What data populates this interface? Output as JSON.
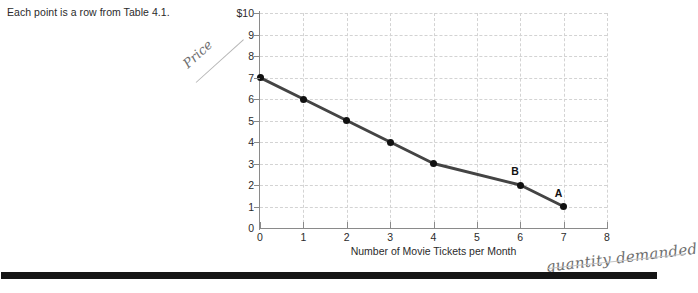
{
  "caption": "Each point is a row from Table 4.1.",
  "chart_data": {
    "type": "line",
    "title": "",
    "xlabel": "Number of Movie Tickets per Month",
    "ylabel": "Price of Movie Tickets",
    "x": [
      0,
      1,
      2,
      3,
      4,
      6,
      7
    ],
    "values": [
      7,
      6,
      5,
      4,
      3,
      2,
      1
    ],
    "xlim": [
      0,
      8
    ],
    "ylim": [
      0,
      10
    ],
    "xticks": [
      "0",
      "1",
      "2",
      "3",
      "4",
      "5",
      "6",
      "7",
      "8"
    ],
    "yticks": [
      "$10",
      "9",
      "8",
      "7",
      "6",
      "5",
      "4",
      "3",
      "2",
      "1",
      "0"
    ],
    "grid": true,
    "legend": "none",
    "series_color": "#444444",
    "point_color": "#111111",
    "grid_color": "#d3d3d3",
    "point_labels": [
      {
        "label": "B",
        "x": 6,
        "y": 2
      },
      {
        "label": "A",
        "x": 7,
        "y": 1
      }
    ]
  },
  "annotations": {
    "price": "Price",
    "quantity_demanded": "quantity demanded"
  }
}
